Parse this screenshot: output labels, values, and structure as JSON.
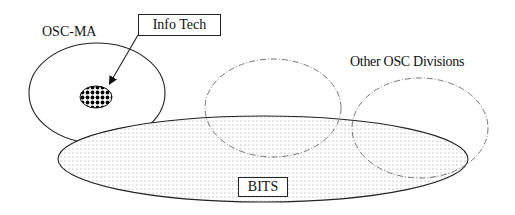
{
  "diagram": {
    "type": "venn-like organizational overlap diagram",
    "nodes": [
      {
        "id": "osc_ma",
        "label": "OSC-MA",
        "shape": "ellipse",
        "style": "solid outline"
      },
      {
        "id": "info_tech",
        "label": "Info Tech",
        "shape": "small ellipse",
        "style": "checkered fill",
        "inside": "osc_ma"
      },
      {
        "id": "other_osc_divisions",
        "label": "Other OSC Divisions",
        "shape": "two ellipses",
        "style": "dash-dot outline"
      },
      {
        "id": "bits",
        "label": "BITS",
        "shape": "wide ellipse",
        "style": "dotted fill"
      }
    ],
    "edges": [
      {
        "from": "info_tech_label",
        "to": "info_tech",
        "type": "arrow"
      }
    ]
  },
  "labels": {
    "osc_ma": "OSC-MA",
    "info_tech": "Info Tech",
    "other_osc_divisions": "Other OSC Divisions",
    "bits": "BITS"
  },
  "colors": {
    "stroke": "#222222",
    "dashed_stroke": "#777777",
    "dot_fill": "#9a9a9a",
    "background": "#ffffff"
  }
}
